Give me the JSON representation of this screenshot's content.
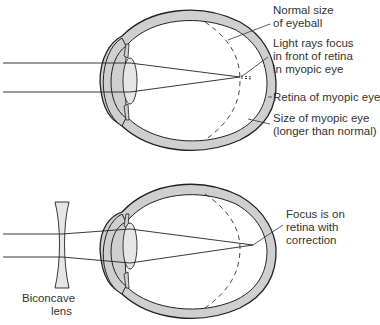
{
  "diagram": {
    "colors": {
      "outline": "#222222",
      "wall_fill": "#cfcfcf",
      "lens_fill": "#e6e6e6",
      "text": "#333333",
      "background": "#ffffff"
    },
    "top_panel": {
      "name": "Myopic eye (uncorrected)",
      "labels": [
        {
          "id": "normal_size",
          "text": "Normal size\nof eyeball"
        },
        {
          "id": "focus_front",
          "text": "Light rays focus\nin front of retina\nin myopic eye"
        },
        {
          "id": "retina",
          "text": "Retina of myopic eye"
        },
        {
          "id": "size_myopic",
          "text": "Size of myopic eye\n(longer than normal)"
        }
      ]
    },
    "bottom_panel": {
      "name": "Myopic eye corrected",
      "labels": [
        {
          "id": "focus_on_retina",
          "text": "Focus is on\nretina with\ncorrection"
        },
        {
          "id": "biconcave_lens",
          "text": "Biconcave\nlens"
        }
      ]
    }
  }
}
